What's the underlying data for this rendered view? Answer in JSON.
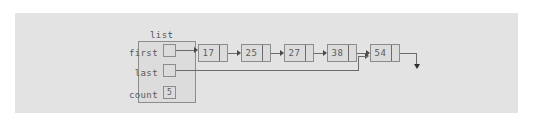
{
  "diagram": {
    "title": "list",
    "struct": {
      "label": "list",
      "fields": [
        {
          "name": "first",
          "kind": "pointer",
          "value": ""
        },
        {
          "name": "last",
          "kind": "pointer",
          "value": ""
        },
        {
          "name": "count",
          "kind": "number",
          "value": "5"
        }
      ]
    },
    "nodes": [
      {
        "value": "17"
      },
      {
        "value": "25"
      },
      {
        "value": "27"
      },
      {
        "value": "38"
      },
      {
        "value": "54"
      }
    ],
    "terminator": "null",
    "colors": {
      "panel_background": "#e3e3e3",
      "page_background": "#ffffff",
      "box_fill": "#dcdcdc",
      "box_border": "#8c8c8c",
      "line": "#6b6b6b",
      "text": "#5a5a5a"
    }
  }
}
